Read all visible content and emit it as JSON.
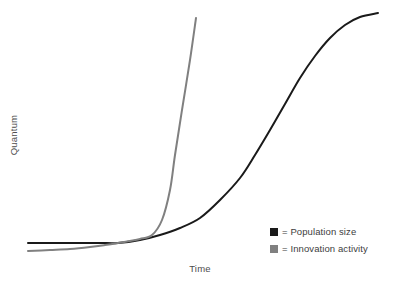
{
  "chart_data": {
    "type": "line",
    "title": "",
    "xlabel": "Time",
    "ylabel": "Quantum",
    "grid": false,
    "axes_visible": false,
    "ticks": [],
    "xlim": [
      0,
      100
    ],
    "ylim": [
      0,
      100
    ],
    "legend_position": "bottom-right",
    "legend_separator": "=",
    "series": [
      {
        "name": "Population size",
        "shape": "logistic-sigmoid",
        "color": "#1a1a1a",
        "linewidth": 2.0,
        "points": [
          [
            28,
            243
          ],
          [
            50,
            243
          ],
          [
            75,
            243
          ],
          [
            100,
            243
          ],
          [
            118,
            243
          ],
          [
            140,
            240
          ],
          [
            160,
            235
          ],
          [
            180,
            228
          ],
          [
            200,
            218
          ],
          [
            220,
            200
          ],
          [
            240,
            178
          ],
          [
            255,
            155
          ],
          [
            270,
            130
          ],
          [
            285,
            104
          ],
          [
            300,
            78
          ],
          [
            315,
            56
          ],
          [
            330,
            38
          ],
          [
            345,
            25
          ],
          [
            360,
            17
          ],
          [
            378,
            13
          ]
        ]
      },
      {
        "name": "Innovation activity",
        "shape": "exponential",
        "color": "#808080",
        "linewidth": 2.0,
        "points": [
          [
            28,
            251
          ],
          [
            50,
            250
          ],
          [
            70,
            249
          ],
          [
            90,
            247
          ],
          [
            105,
            245
          ],
          [
            118,
            243
          ],
          [
            130,
            241
          ],
          [
            140,
            239
          ],
          [
            152,
            235
          ],
          [
            162,
            220
          ],
          [
            170,
            190
          ],
          [
            175,
            155
          ],
          [
            182,
            110
          ],
          [
            190,
            60
          ],
          [
            196,
            18
          ]
        ]
      }
    ]
  },
  "legend": {
    "entries": [
      {
        "swatch_color": "#1a1a1a",
        "label": "= Population size",
        "icon": "black-square-icon"
      },
      {
        "swatch_color": "#808080",
        "label": "= Innovation activity",
        "icon": "gray-square-icon"
      }
    ]
  },
  "labels": {
    "y_axis": "Quantum",
    "x_axis": "Time"
  },
  "colors": {
    "background": "#ffffff",
    "population_curve": "#1a1a1a",
    "innovation_curve": "#808080",
    "text": "#4d4d4d"
  }
}
